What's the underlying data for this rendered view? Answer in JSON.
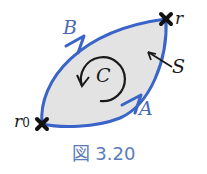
{
  "figure": {
    "caption": "図 3.20",
    "labels": {
      "A": "A",
      "B": "B",
      "C": "C",
      "S": "S",
      "r": "r",
      "r0_base": "r",
      "r0_sub": "0"
    },
    "colors": {
      "path": "#3a64c8",
      "label_blue": "#4a6ab8",
      "fill": "#e3e3e3",
      "ink": "#1a1a1a",
      "caption": "#5a7cb8"
    }
  }
}
